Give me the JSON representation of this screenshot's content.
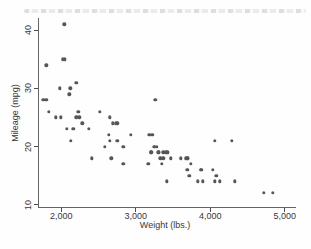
{
  "chart_data": {
    "type": "scatter",
    "title": "",
    "xlabel": "Weight (lbs.)",
    "ylabel": "Mileage (mpg)",
    "xlim": [
      1690,
      5140
    ],
    "ylim": [
      9,
      42
    ],
    "grid": false,
    "legend": "none",
    "marker_color": "#565656",
    "axis_color": "#636363",
    "text_color": "#383838",
    "x_ticks": [
      {
        "value": 2000,
        "label": "2,000"
      },
      {
        "value": 3000,
        "label": "3,000"
      },
      {
        "value": 4000,
        "label": "4,000"
      },
      {
        "value": 5000,
        "label": "5,000"
      }
    ],
    "y_ticks": [
      {
        "value": 10,
        "label": "10"
      },
      {
        "value": 20,
        "label": "20"
      },
      {
        "value": 30,
        "label": "30"
      },
      {
        "value": 40,
        "label": "40"
      }
    ],
    "series": [
      {
        "name": "mileage-vs-weight",
        "marker": "circle",
        "color": "#565656",
        "points": [
          [
            2930,
            22
          ],
          [
            3350,
            17
          ],
          [
            2640,
            22
          ],
          [
            3250,
            20
          ],
          [
            4080,
            15
          ],
          [
            3670,
            18
          ],
          [
            2230,
            26
          ],
          [
            3280,
            20
          ],
          [
            3880,
            16
          ],
          [
            3400,
            19
          ],
          [
            4330,
            14
          ],
          [
            3900,
            14
          ],
          [
            4290,
            21
          ],
          [
            2110,
            29
          ],
          [
            3690,
            16
          ],
          [
            3180,
            22
          ],
          [
            3220,
            22
          ],
          [
            2750,
            24
          ],
          [
            3430,
            19
          ],
          [
            2120,
            30
          ],
          [
            3600,
            18
          ],
          [
            3870,
            16
          ],
          [
            3740,
            17
          ],
          [
            1800,
            28
          ],
          [
            2650,
            21
          ],
          [
            4840,
            12
          ],
          [
            4720,
            12
          ],
          [
            3830,
            14
          ],
          [
            2580,
            20
          ],
          [
            4060,
            14
          ],
          [
            3720,
            15
          ],
          [
            3370,
            18
          ],
          [
            4130,
            14
          ],
          [
            2830,
            20
          ],
          [
            4060,
            21
          ],
          [
            3310,
            19
          ],
          [
            3300,
            19
          ],
          [
            3690,
            18
          ],
          [
            3370,
            19
          ],
          [
            2730,
            24
          ],
          [
            4030,
            16
          ],
          [
            3260,
            28
          ],
          [
            1800,
            34
          ],
          [
            2200,
            25
          ],
          [
            2520,
            26
          ],
          [
            3330,
            18
          ],
          [
            3700,
            18
          ],
          [
            3470,
            18
          ],
          [
            3210,
            19
          ],
          [
            3200,
            19
          ],
          [
            3420,
            19
          ],
          [
            2690,
            24
          ],
          [
            2830,
            17
          ],
          [
            2070,
            23
          ],
          [
            2650,
            25
          ],
          [
            2370,
            23
          ],
          [
            2020,
            35
          ],
          [
            2280,
            24
          ],
          [
            2750,
            21
          ],
          [
            2130,
            21
          ],
          [
            2240,
            25
          ],
          [
            1760,
            28
          ],
          [
            1980,
            30
          ],
          [
            3420,
            14
          ],
          [
            1830,
            26
          ],
          [
            2050,
            35
          ],
          [
            2410,
            18
          ],
          [
            2200,
            31
          ],
          [
            2670,
            18
          ],
          [
            2160,
            23
          ],
          [
            2040,
            41
          ],
          [
            1930,
            25
          ],
          [
            1990,
            25
          ],
          [
            3170,
            17
          ]
        ]
      }
    ]
  }
}
